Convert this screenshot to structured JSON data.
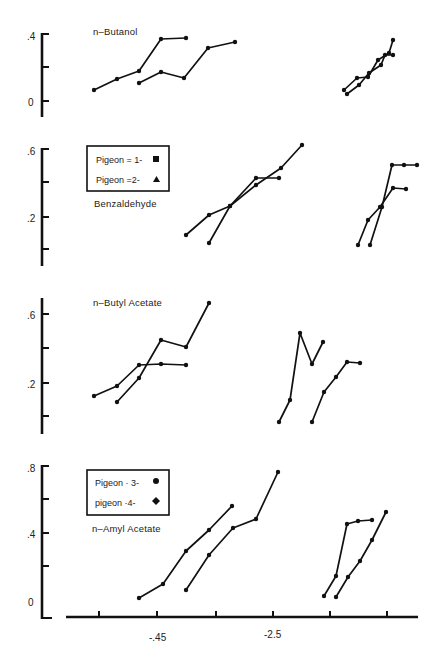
{
  "chart_data": [
    {
      "type": "line",
      "title": "n-Butanol",
      "ylabel": "",
      "yticks": [
        ".4",
        "",
        "0"
      ],
      "ylim": [
        -0.1,
        0.4
      ],
      "series": [
        {
          "name": "left-series-a",
          "points": [
            [
              94,
              90
            ],
            [
              117,
              79
            ],
            [
              139,
              71
            ],
            [
              161,
              39
            ],
            [
              186,
              38
            ]
          ]
        },
        {
          "name": "left-series-b",
          "points": [
            [
              139,
              83
            ],
            [
              161,
              72
            ],
            [
              184,
              78
            ],
            [
              208,
              48
            ],
            [
              235,
              42
            ]
          ]
        },
        {
          "name": "right-series-a",
          "points": [
            [
              344,
              90
            ],
            [
              357,
              78
            ],
            [
              368,
              77
            ],
            [
              378,
              60
            ],
            [
              389,
              53
            ],
            [
              393,
              40
            ]
          ]
        },
        {
          "name": "right-series-b",
          "points": [
            [
              347,
              94
            ],
            [
              359,
              85
            ],
            [
              369,
              73
            ],
            [
              381,
              65
            ],
            [
              385,
              55
            ],
            [
              393,
              55
            ]
          ]
        }
      ]
    },
    {
      "type": "line",
      "title": "Benzaldehyde",
      "ylabel": "",
      "yticks": [
        ".6",
        "",
        ".2",
        ""
      ],
      "ylim": [
        -0.1,
        0.6
      ],
      "legend": [
        {
          "label": "Pigeon = 1-",
          "marker": "square"
        },
        {
          "label": "Pigeon =2-",
          "marker": "triangle"
        }
      ],
      "series": [
        {
          "name": "pigeon-1-left",
          "points": [
            [
              209,
              243
            ],
            [
              230,
              206
            ],
            [
              256,
              178
            ],
            [
              279,
              178
            ]
          ]
        },
        {
          "name": "pigeon-2-left",
          "points": [
            [
              186,
              235
            ],
            [
              209,
              215
            ],
            [
              230,
              206
            ],
            [
              256,
              185
            ],
            [
              281,
              168
            ],
            [
              302,
              145
            ]
          ]
        },
        {
          "name": "pigeon-1-right",
          "points": [
            [
              358,
              245
            ],
            [
              368,
              220
            ],
            [
              380,
              207
            ],
            [
              393,
              188
            ],
            [
              406,
              189
            ]
          ]
        },
        {
          "name": "pigeon-2-right",
          "points": [
            [
              370,
              245
            ],
            [
              382,
              207
            ],
            [
              392,
              165
            ],
            [
              404,
              165
            ],
            [
              417,
              165
            ]
          ]
        }
      ]
    },
    {
      "type": "line",
      "title": "n-Butyl Acetate",
      "ylabel": "",
      "yticks": [
        ".6",
        "",
        ".2",
        ""
      ],
      "ylim": [
        -0.1,
        0.7
      ],
      "series": [
        {
          "name": "left-series-a",
          "points": [
            [
              94,
              396
            ],
            [
              117,
              386
            ],
            [
              139,
              365
            ],
            [
              161,
              364
            ],
            [
              186,
              365
            ]
          ]
        },
        {
          "name": "left-series-b",
          "points": [
            [
              117,
              402
            ],
            [
              139,
              378
            ],
            [
              161,
              340
            ],
            [
              186,
              347
            ],
            [
              209,
              303
            ]
          ]
        },
        {
          "name": "right-series-a",
          "points": [
            [
              279,
              422
            ],
            [
              290,
              400
            ],
            [
              300,
              333
            ],
            [
              312,
              364
            ],
            [
              323,
              342
            ]
          ]
        },
        {
          "name": "right-series-b",
          "points": [
            [
              312,
              422
            ],
            [
              324,
              392
            ],
            [
              336,
              377
            ],
            [
              347,
              362
            ],
            [
              360,
              363
            ]
          ]
        }
      ]
    },
    {
      "type": "line",
      "title": "n-Amyl Acetate",
      "ylabel": "",
      "yticks": [
        ".8",
        "",
        ".4",
        "",
        "0"
      ],
      "ylim": [
        -0.1,
        0.8
      ],
      "legend": [
        {
          "label": "Pigeon = 3-",
          "marker": "circle"
        },
        {
          "label": "pigeon =4-",
          "marker": "diamond"
        }
      ],
      "series": [
        {
          "name": "pigeon-3-left",
          "points": [
            [
              139,
              598
            ],
            [
              163,
              584
            ],
            [
              186,
              551
            ],
            [
              209,
              530
            ],
            [
              232,
              506
            ]
          ]
        },
        {
          "name": "pigeon-4-left",
          "points": [
            [
              186,
              590
            ],
            [
              209,
              555
            ],
            [
              233,
              528
            ],
            [
              256,
              519
            ],
            [
              278,
              472
            ]
          ]
        },
        {
          "name": "pigeon-3-right",
          "points": [
            [
              324,
              596
            ],
            [
              336,
              576
            ],
            [
              347,
              524
            ],
            [
              358,
              521
            ],
            [
              372,
              520
            ]
          ]
        },
        {
          "name": "pigeon-4-right",
          "points": [
            [
              336,
              597
            ],
            [
              348,
              577
            ],
            [
              360,
              561
            ],
            [
              372,
              540
            ],
            [
              386,
              512
            ]
          ]
        }
      ]
    }
  ],
  "x_axis": {
    "tick_labels": [
      "-.45",
      "-2.5"
    ],
    "tick_positions": [
      99,
      157,
      216,
      273,
      330,
      387
    ]
  },
  "panels": {
    "butanol_title": "n–Butanol",
    "benzaldehyde_title": "Benzaldehyde",
    "butyl_title": "n–Butyl   Acetate",
    "amyl_title": "n–Amyl   Acetate"
  },
  "yticks": {
    "p1_top": ".4",
    "p1_zero": "0",
    "p2_top": ".6",
    "p2_mid": ".2",
    "p3_top": ".6",
    "p3_mid": ".2",
    "p4_top": ".8",
    "p4_mid": ".4",
    "p4_zero": "0"
  },
  "legends": {
    "top": {
      "row1": "Pigeon  =  1-",
      "row2": "Pigeon  =2-"
    },
    "bottom": {
      "row1": "Pigeon  · 3-",
      "row2": "pigeon  ·4-"
    }
  },
  "xlabels": {
    "a": "-.45",
    "b": "-2.5"
  }
}
